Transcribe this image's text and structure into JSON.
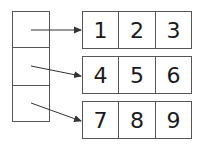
{
  "diagram": {
    "pointer_array": {
      "slots": 3
    },
    "rows": [
      {
        "cells": [
          "1",
          "2",
          "3"
        ]
      },
      {
        "cells": [
          "4",
          "5",
          "6"
        ]
      },
      {
        "cells": [
          "7",
          "8",
          "9"
        ]
      }
    ],
    "colors": {
      "stroke": "#555555",
      "text": "#1a1a1a",
      "background": "#ffffff"
    }
  }
}
